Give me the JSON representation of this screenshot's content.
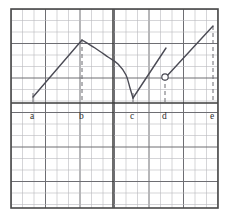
{
  "figure": {
    "kind": "graph-paper-plot",
    "title": "",
    "background_color": "#ffffff",
    "border_color": "#4a4a4a",
    "grid": {
      "minor_color": "#b9b9bd",
      "major_color": "#6e6e73",
      "minor_spacing_px": 11.5,
      "major_every": 3,
      "plot_left_px": 11,
      "plot_top_px": 9,
      "plot_right_px": 218,
      "plot_bottom_px": 208
    },
    "axes": {
      "x_axis_y_px": 103,
      "y_axis_x_px": 113,
      "axis_color": "#3c3c3c",
      "x_axis_label": "",
      "y_axis_label": ""
    },
    "curve": {
      "stroke_color": "#4b4b55",
      "stroke_width": 1.4
    },
    "dashes": {
      "color": "#6a6a70",
      "pattern": "4 3"
    },
    "open_point": {
      "fill": "#ffffff",
      "stroke": "#4b4b55",
      "radius_px": 3.2,
      "x_px": 165,
      "y_px": 77
    }
  },
  "x_labels": [
    {
      "id": "a",
      "text": "a",
      "x_px": 33,
      "label_x_px": 30,
      "label_y_px": 119
    },
    {
      "id": "b",
      "text": "b",
      "x_px": 82,
      "label_x_px": 79,
      "label_y_px": 119
    },
    {
      "id": "c",
      "text": "c",
      "x_px": 133,
      "label_x_px": 130,
      "label_y_px": 119
    },
    {
      "id": "d",
      "text": "d",
      "x_px": 165,
      "label_x_px": 162,
      "label_y_px": 119
    },
    {
      "id": "e",
      "text": "e",
      "x_px": 213,
      "label_x_px": 210,
      "label_y_px": 119
    }
  ],
  "chart_data": {
    "type": "line",
    "title": "",
    "xlabel": "",
    "ylabel": "",
    "xlim": [
      11,
      218
    ],
    "ylim": [
      208,
      9
    ],
    "grid": true,
    "legend": "none",
    "tick_labels": [
      "a",
      "b",
      "c",
      "d",
      "e"
    ],
    "tick_x": [
      33,
      82,
      133,
      165,
      213
    ],
    "segments": [
      {
        "name": "rise-to-peak",
        "from": "a",
        "to": "b",
        "shape": "straight-increasing",
        "points": [
          [
            33,
            97
          ],
          [
            82,
            40
          ]
        ]
      },
      {
        "name": "decline-to-cusp",
        "from": "b",
        "to": "c",
        "shape": "concave-decreasing",
        "points": [
          [
            82,
            40
          ],
          [
            95,
            48
          ],
          [
            108,
            57
          ],
          [
            118,
            64
          ],
          [
            126,
            75
          ],
          [
            130,
            88
          ],
          [
            133,
            98
          ]
        ]
      },
      {
        "name": "rise-to-jump",
        "from": "c",
        "to": "d",
        "shape": "straight-increasing",
        "points": [
          [
            133,
            98
          ],
          [
            166,
            48
          ]
        ]
      },
      {
        "name": "post-jump-rise",
        "from": "d",
        "to": "e",
        "shape": "straight-increasing",
        "points": [
          [
            166,
            77
          ],
          [
            213,
            26
          ]
        ]
      }
    ],
    "markers": [
      {
        "kind": "open-circle",
        "x": 165,
        "y": 77,
        "at": "d",
        "meaning": "removable/jump discontinuity"
      }
    ],
    "vertical_guides": [
      {
        "at": "a",
        "x": 33,
        "y_top": 93,
        "y_bottom": 103,
        "style": "solid"
      },
      {
        "at": "b",
        "x": 82,
        "y_top": 40,
        "y_bottom": 103,
        "style": "dashed"
      },
      {
        "at": "c",
        "x": 133,
        "y_top": 93,
        "y_bottom": 103,
        "style": "solid"
      },
      {
        "at": "d",
        "x": 165,
        "y_top": 77,
        "y_bottom": 103,
        "style": "dashed"
      },
      {
        "at": "e",
        "x": 213,
        "y_top": 26,
        "y_bottom": 103,
        "style": "dashed"
      }
    ]
  }
}
